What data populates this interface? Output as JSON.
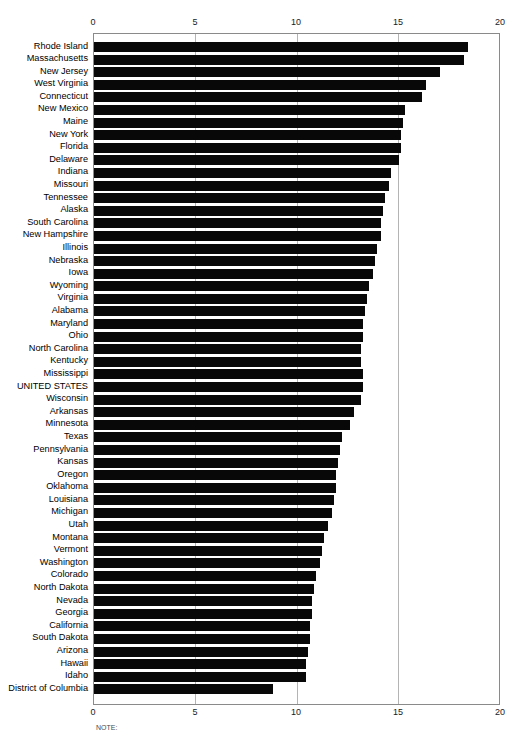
{
  "chart_data": {
    "type": "bar",
    "orientation": "horizontal",
    "title": "",
    "xlabel": "",
    "ylabel": "",
    "xlim": [
      0,
      20
    ],
    "xticks": [
      0,
      5,
      10,
      15,
      20
    ],
    "xtick_labels": [
      "0",
      "5",
      "10",
      "15",
      "20"
    ],
    "grid": true,
    "grid_axis": "x",
    "legend": "none",
    "axis_position": "both-top-and-bottom",
    "bar_color": "#080808",
    "categories": [
      "Rhode Island",
      "Massachusetts",
      "New Jersey",
      "West Virginia",
      "Connecticut",
      "New Mexico",
      "Maine",
      "New York",
      "Florida",
      "Delaware",
      "Indiana",
      "Missouri",
      "Tennessee",
      "Alaska",
      "South Carolina",
      "New Hampshire",
      "Illinois",
      "Nebraska",
      "Iowa",
      "Wyoming",
      "Virginia",
      "Alabama",
      "Maryland",
      "Ohio",
      "North Carolina",
      "Kentucky",
      "Mississippi",
      "UNITED STATES",
      "Wisconsin",
      "Arkansas",
      "Minnesota",
      "Texas",
      "Pennsylvania",
      "Kansas",
      "Oregon",
      "Oklahoma",
      "Louisiana",
      "Michigan",
      "Utah",
      "Montana",
      "Vermont",
      "Washington",
      "Colorado",
      "North Dakota",
      "Nevada",
      "Georgia",
      "California",
      "South Dakota",
      "Arizona",
      "Hawaii",
      "Idaho",
      "District of Columbia"
    ],
    "values": [
      18.4,
      18.2,
      17.0,
      16.3,
      16.1,
      15.3,
      15.2,
      15.1,
      15.1,
      15.0,
      14.6,
      14.5,
      14.3,
      14.2,
      14.1,
      14.1,
      13.9,
      13.8,
      13.7,
      13.5,
      13.4,
      13.3,
      13.2,
      13.2,
      13.1,
      13.1,
      13.2,
      13.2,
      13.1,
      12.8,
      12.6,
      12.2,
      12.1,
      12.0,
      11.9,
      11.9,
      11.8,
      11.7,
      11.5,
      11.3,
      11.2,
      11.1,
      10.9,
      10.8,
      10.7,
      10.7,
      10.6,
      10.6,
      10.5,
      10.4,
      10.4,
      8.8
    ]
  },
  "axis": {
    "top_ticks": [
      "0",
      "5",
      "10",
      "15",
      "20"
    ],
    "bottom_ticks": [
      "0",
      "5",
      "10",
      "15",
      "20"
    ]
  },
  "note": {
    "text": "NOTE:"
  }
}
